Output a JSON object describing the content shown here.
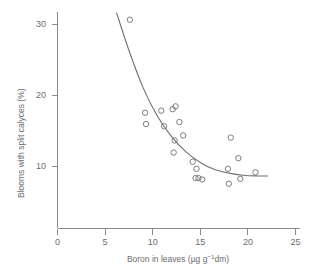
{
  "chart_data": {
    "type": "scatter",
    "title": "",
    "xlabel": "Boron in leaves (µg g⁻¹dm)",
    "xlabel_parts": {
      "main": "Boron in leaves (µg g",
      "superscript": "−1",
      "tail": "dm)"
    },
    "ylabel": "Blooms with split calyces (%)",
    "xlim": [
      0,
      25
    ],
    "ylim": [
      0,
      33
    ],
    "xticks": [
      0,
      5,
      10,
      15,
      20,
      25
    ],
    "xtick_labels": [
      "0",
      "5",
      "10",
      "15",
      "20",
      "25"
    ],
    "yticks": [
      10,
      20,
      30
    ],
    "ytick_labels": [
      "10",
      "20",
      "30"
    ],
    "grid": false,
    "legend": null,
    "marker_style": "open-circle",
    "points": [
      {
        "x": 7.6,
        "y": 30.6
      },
      {
        "x": 9.2,
        "y": 17.5
      },
      {
        "x": 9.3,
        "y": 15.9
      },
      {
        "x": 10.9,
        "y": 17.8
      },
      {
        "x": 11.2,
        "y": 15.6
      },
      {
        "x": 12.1,
        "y": 18.0
      },
      {
        "x": 12.4,
        "y": 18.4
      },
      {
        "x": 12.3,
        "y": 13.6
      },
      {
        "x": 12.8,
        "y": 16.2
      },
      {
        "x": 12.2,
        "y": 11.9
      },
      {
        "x": 13.2,
        "y": 14.3
      },
      {
        "x": 14.2,
        "y": 10.6
      },
      {
        "x": 14.6,
        "y": 9.6
      },
      {
        "x": 14.5,
        "y": 8.3
      },
      {
        "x": 14.8,
        "y": 8.3
      },
      {
        "x": 15.2,
        "y": 8.1
      },
      {
        "x": 17.9,
        "y": 9.6
      },
      {
        "x": 18.0,
        "y": 7.5
      },
      {
        "x": 18.2,
        "y": 14.0
      },
      {
        "x": 19.0,
        "y": 11.1
      },
      {
        "x": 19.2,
        "y": 8.2
      },
      {
        "x": 20.8,
        "y": 9.1
      }
    ],
    "fit_curve": {
      "kind": "exponential-decay",
      "description": "Fitted declining curve through the scatter",
      "points": [
        {
          "x": 6.2,
          "y": 31.6
        },
        {
          "x": 7.5,
          "y": 26.3
        },
        {
          "x": 9.0,
          "y": 21.0
        },
        {
          "x": 10.5,
          "y": 17.0
        },
        {
          "x": 12.0,
          "y": 14.1
        },
        {
          "x": 13.5,
          "y": 12.0
        },
        {
          "x": 15.0,
          "y": 10.5
        },
        {
          "x": 16.5,
          "y": 9.5
        },
        {
          "x": 18.0,
          "y": 9.0
        },
        {
          "x": 19.5,
          "y": 8.7
        },
        {
          "x": 21.0,
          "y": 8.6
        },
        {
          "x": 22.1,
          "y": 8.6
        }
      ]
    }
  }
}
